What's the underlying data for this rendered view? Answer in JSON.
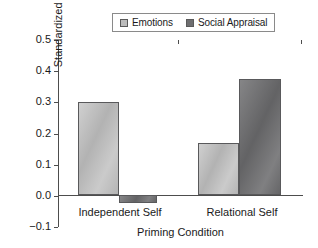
{
  "chart_data": {
    "type": "bar",
    "title": "",
    "xlabel": "Priming Condition",
    "ylabel": "Standardized Beta",
    "categories": [
      "Independent Self",
      "Relational Self"
    ],
    "series": [
      {
        "name": "Emotions",
        "color": "#bcbcbc",
        "values": [
          0.36,
          0.2
        ]
      },
      {
        "name": "Social Appraisal",
        "color": "#6e6e70",
        "values": [
          -0.03,
          0.45
        ]
      }
    ],
    "ylim": [
      -0.1,
      0.5
    ],
    "yticks": [
      0.5,
      0.4,
      0.3,
      0.2,
      0.1,
      0.0,
      -0.1
    ],
    "ytick_labels": [
      "0.5",
      "0.4",
      "0.3",
      "0.2",
      "0.1",
      "0.0",
      "−0.1"
    ],
    "grid": false,
    "legend_position": "top-center",
    "zero_line": 0.0
  },
  "legend": {
    "entries": [
      {
        "label": "Emotions",
        "swatch": "#bcbcbc"
      },
      {
        "label": "Social Appraisal",
        "swatch": "#6e6e70"
      }
    ]
  }
}
